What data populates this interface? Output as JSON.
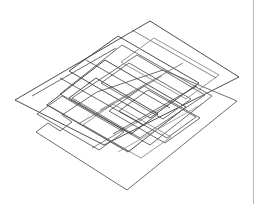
{
  "figure": {
    "kind": "axonometric-line-drawing",
    "projection": "axonometric (parallel) projection",
    "background_color": "#ffffff",
    "canvas": {
      "width": 264,
      "height": 204
    },
    "caption": "",
    "title": "",
    "alt_text": "Axonometric line drawing of several overlapping rectangular floor plates stacked in parallel projection"
  },
  "style": {
    "line_color_dark": "#3a3a3a",
    "line_color_mid": "#5d5d5d",
    "line_color_light": "#8a8a8a",
    "line_width_outline": 0.9,
    "line_width_partition": 0.75,
    "rule_color": "#b9b9b9"
  },
  "page_rule": {
    "name": "vertical-page-rule",
    "x": 253,
    "y": 0,
    "height": 204,
    "color": "#b9b9b9"
  },
  "geometry": {
    "note": "All coordinates are in the 264x204 image pixel space. Axonometric unit vectors: right-down u=(1,0.505), right-up v=(1,-0.505).",
    "slabs": [
      {
        "name": "slab-upper-plate",
        "color": "#3a3a3a",
        "points": "150,21 239,77 104,145 15,100 150,21"
      },
      {
        "name": "slab-lower-plate",
        "color": "#5d5d5d",
        "points": "163,70 237,101 127,190 36,132 48,123 60,131 72,122 62,115 97,92 163,70"
      },
      {
        "name": "slab-mid-plate",
        "color": "#5d5d5d",
        "points": "122,45 212,96 150,145 60,94 122,45"
      },
      {
        "name": "slab-core-a",
        "color": "#3a3a3a",
        "points": "105,60 186,107 128,152 47,105 105,60"
      },
      {
        "name": "slab-core-b",
        "color": "#5d5d5d",
        "points": "137,55 205,95 140,138 72,98 137,55"
      }
    ],
    "partitions": [
      {
        "name": "partition-1",
        "color": "#3a3a3a",
        "points": "60,78 143,125"
      },
      {
        "name": "partition-2",
        "color": "#3a3a3a",
        "points": "86,60 170,108"
      },
      {
        "name": "partition-3",
        "color": "#5d5d5d",
        "points": "100,110 183,63"
      },
      {
        "name": "partition-4",
        "color": "#5d5d5d",
        "points": "78,124 162,76"
      },
      {
        "name": "partition-5",
        "color": "#3a3a3a",
        "points": "113,134 197,86"
      },
      {
        "name": "partition-6",
        "color": "#5d5d5d",
        "points": "46,104 130,152"
      },
      {
        "name": "partition-7",
        "color": "#5d5d5d",
        "points": "132,30 216,78"
      },
      {
        "name": "partition-8",
        "color": "#3a3a3a",
        "points": "32,96 116,48"
      },
      {
        "name": "partition-9",
        "color": "#5d5d5d",
        "points": "92,148 176,100"
      },
      {
        "name": "partition-10",
        "color": "#8a8a8a",
        "points": "118,152 202,104"
      }
    ],
    "rect_frames": [
      {
        "name": "frame-1",
        "color": "#3a3a3a",
        "points": "118,36 199,83 150,118 69,71 118,36"
      },
      {
        "name": "frame-2",
        "color": "#5d5d5d",
        "points": "144,86 200,118 165,143 109,111 144,86"
      },
      {
        "name": "frame-3",
        "color": "#5d5d5d",
        "points": "148,90 196,117 167,138 119,111 148,90"
      },
      {
        "name": "frame-4",
        "color": "#8a8a8a",
        "points": "113,104 171,137 141,158 83,125 113,104"
      },
      {
        "name": "frame-5",
        "color": "#3a3a3a",
        "points": "96,78 158,114 131,134 69,98 96,78"
      },
      {
        "name": "frame-6",
        "color": "#5d5d5d",
        "points": "129,63 191,99 163,119 101,83 129,63"
      },
      {
        "name": "frame-7",
        "color": "#8a8a8a",
        "points": "154,38 219,75 186,99 121,62 154,38"
      },
      {
        "name": "frame-8",
        "color": "#5d5d5d",
        "points": "62,96 124,132 99,150 37,114 62,96"
      }
    ]
  }
}
